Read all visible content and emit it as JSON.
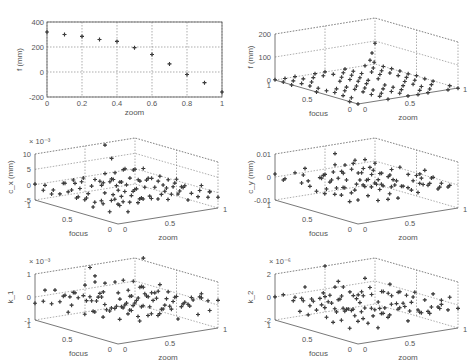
{
  "figure": {
    "panel_count": 6,
    "layout": "3 rows x 2 columns"
  },
  "chart_data": [
    {
      "id": "f_vs_zoom",
      "type": "scatter",
      "title": "",
      "xlabel": "zoom",
      "ylabel": "f (mm)",
      "xlim": [
        0,
        1
      ],
      "ylim": [
        -200,
        400
      ],
      "xticks": [
        "0",
        "0.2",
        "0.4",
        "0.6",
        "0.8",
        "1"
      ],
      "yticks": [
        "-200",
        "0",
        "200",
        "400"
      ],
      "grid": true,
      "x": [
        0,
        0.1,
        0.2,
        0.3,
        0.4,
        0.5,
        0.6,
        0.7,
        0.8,
        0.9,
        1.0
      ],
      "y": [
        320,
        300,
        285,
        260,
        245,
        195,
        140,
        65,
        -20,
        -85,
        -160
      ]
    },
    {
      "id": "f_3d",
      "type": "scatter3d",
      "xlabel": "focus",
      "ylabel": "zoom",
      "zlabel": "f (mm)",
      "zticks": [
        "0",
        "100",
        "200"
      ],
      "focus_ticks": [
        "1",
        "0.5",
        "0"
      ],
      "zoom_ticks": [
        "0",
        "0.5",
        "1"
      ],
      "zlim": [
        0,
        200
      ],
      "exponent": "",
      "note": "grid of points near z=0 with a few outliers up to ~150 at high zoom"
    },
    {
      "id": "cx_3d",
      "type": "scatter3d",
      "xlabel": "focus",
      "ylabel": "zoom",
      "zlabel": "c_x (mm)",
      "zticks": [
        "-5",
        "0",
        "5",
        "10"
      ],
      "focus_ticks": [
        "1",
        "0.5",
        "0"
      ],
      "zoom_ticks": [
        "0",
        "0.5",
        "1"
      ],
      "zlim": [
        -5,
        10
      ],
      "exponent": "× 10⁻³"
    },
    {
      "id": "cy_3d",
      "type": "scatter3d",
      "xlabel": "focus",
      "ylabel": "zoom",
      "zlabel": "c_y (mm)",
      "zticks": [
        "-0.01",
        "0",
        "0.01"
      ],
      "focus_ticks": [
        "1",
        "0.5",
        "0"
      ],
      "zoom_ticks": [
        "0",
        "0.5",
        "1"
      ],
      "zlim": [
        -0.01,
        0.01
      ],
      "exponent": ""
    },
    {
      "id": "k1_3d",
      "type": "scatter3d",
      "xlabel": "focus",
      "ylabel": "zoom",
      "zlabel": "k_1",
      "zticks": [
        "-1",
        "0",
        "1"
      ],
      "focus_ticks": [
        "1",
        "0.5",
        "0"
      ],
      "zoom_ticks": [
        "0",
        "0.5",
        "1"
      ],
      "zlim": [
        -1,
        1
      ],
      "exponent": "× 10⁻³"
    },
    {
      "id": "k2_3d",
      "type": "scatter3d",
      "xlabel": "focus",
      "ylabel": "zoom",
      "zlabel": "k_2",
      "zticks": [
        "-2",
        "0",
        "2"
      ],
      "focus_ticks": [
        "1",
        "0.5",
        "0"
      ],
      "zoom_ticks": [
        "0",
        "0.5",
        "1"
      ],
      "zlim": [
        -2,
        2
      ],
      "exponent": "× 10⁻⁶"
    }
  ]
}
